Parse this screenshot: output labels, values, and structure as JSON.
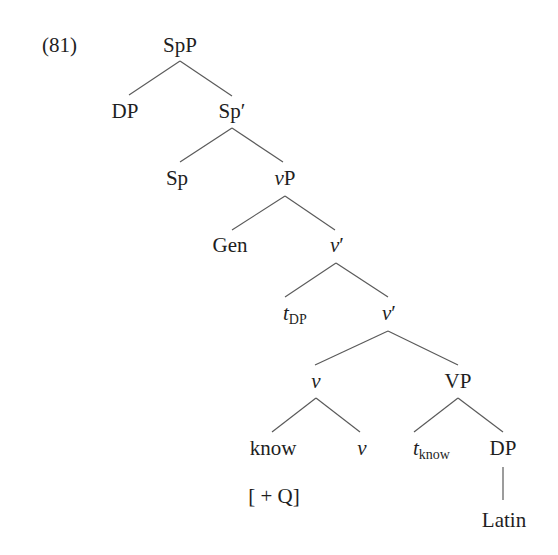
{
  "example": {
    "number": "(81)"
  },
  "tree": {
    "nodes": {
      "root": {
        "label": "SpP"
      },
      "dp_spec": {
        "label": "DP"
      },
      "sp_bar": {
        "label": "Sp",
        "prime": "′"
      },
      "sp_head": {
        "label": "Sp"
      },
      "vp_little": {
        "italic": "v",
        "label": "P"
      },
      "gen": {
        "label": "Gen"
      },
      "v_bar_1": {
        "italic": "v",
        "prime": "′"
      },
      "t_dp": {
        "italic": "t",
        "subscript": "DP"
      },
      "v_bar_2": {
        "italic": "v",
        "prime": "′"
      },
      "v_head_complex": {
        "italic": "v"
      },
      "vp_big": {
        "label": "VP"
      },
      "know": {
        "label": "know",
        "feature": "[ + Q]"
      },
      "v_head": {
        "italic": "v"
      },
      "t_know": {
        "italic": "t",
        "subscript": "know"
      },
      "dp_obj": {
        "label": "DP"
      },
      "latin": {
        "label": "Latin"
      }
    },
    "edges": [
      [
        "SpP",
        "DP"
      ],
      [
        "SpP",
        "Sp′"
      ],
      [
        "Sp′",
        "Sp"
      ],
      [
        "Sp′",
        "vP"
      ],
      [
        "vP",
        "Gen"
      ],
      [
        "vP",
        "v′"
      ],
      [
        "v′",
        "t_DP"
      ],
      [
        "v′",
        "v′"
      ],
      [
        "v′",
        "v"
      ],
      [
        "v′",
        "VP"
      ],
      [
        "v",
        "know"
      ],
      [
        "v",
        "v"
      ],
      [
        "VP",
        "t_know"
      ],
      [
        "VP",
        "DP"
      ],
      [
        "DP",
        "Latin"
      ]
    ]
  }
}
